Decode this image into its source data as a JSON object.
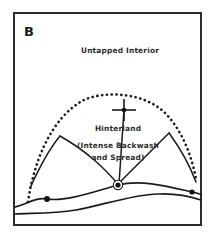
{
  "figure": {
    "panel_label": "B",
    "background_color": "#ffffff",
    "ink_color": "#1a1a1a",
    "frame": {
      "x": 14,
      "y": 13,
      "width": 187,
      "height": 212,
      "stroke_color": "#2b2b2b"
    },
    "labels": [
      {
        "text": "Untapped Interior",
        "x": 120,
        "y": 53
      },
      {
        "text": "Hinterland",
        "x": 118,
        "y": 131
      },
      {
        "text": "(Intense Backwash",
        "x": 118,
        "y": 148
      },
      {
        "text": "and Spread)",
        "x": 118,
        "y": 160
      }
    ],
    "markers": {
      "hinterland_cross": {
        "x": 124,
        "y": 110,
        "arm_h": 12,
        "arm_v": 11
      },
      "port_node": {
        "x": 118,
        "y": 185,
        "radius": 5.2
      },
      "west_settlement": {
        "x": 47,
        "y": 199,
        "radius": 2.8
      },
      "east_settlement": {
        "x": 192,
        "y": 192,
        "radius": 2.6
      }
    },
    "frontier_arc_style": "dotted",
    "coastline_count": 2,
    "interior_route_count": 2
  }
}
